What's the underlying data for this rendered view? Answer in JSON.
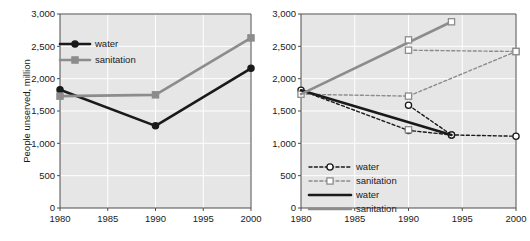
{
  "figure": {
    "panels": [
      {
        "id": "left-panel",
        "name": "actual-trends-chart",
        "chart_data": {
          "type": "line",
          "title": "",
          "xlabel": "",
          "ylabel": "People unserved, million",
          "xlim": [
            1980,
            2000
          ],
          "ylim": [
            0,
            3000
          ],
          "xticks": [
            1980,
            1985,
            1990,
            1995,
            2000
          ],
          "xtick_labels": [
            "1980",
            "1985",
            "1990",
            "1995",
            "2000"
          ],
          "yticks": [
            0,
            500,
            1000,
            1500,
            2000,
            2500,
            3000
          ],
          "ytick_labels": [
            "0",
            "500",
            "1,000",
            "1,500",
            "2,000",
            "2,500",
            "3,000"
          ],
          "grid": true,
          "legend_position": "upper-left-inside",
          "series": [
            {
              "name": "water",
              "label": "water",
              "color": "#1a1a1a",
              "style": "solid",
              "marker": "circle",
              "x": [
                1980,
                1990,
                2000
              ],
              "values": [
                1830,
                1270,
                2160
              ]
            },
            {
              "name": "sanitation",
              "label": "sanitation",
              "color": "#8c8c8c",
              "style": "solid",
              "marker": "square",
              "x": [
                1980,
                1990,
                2000
              ],
              "values": [
                1730,
                1750,
                2630
              ]
            }
          ]
        }
      },
      {
        "id": "right-panel",
        "name": "projected-trends-chart",
        "chart_data": {
          "type": "line",
          "title": "",
          "xlabel": "",
          "ylabel": "",
          "xlim": [
            1980,
            2000
          ],
          "ylim": [
            0,
            3000
          ],
          "xticks": [
            1980,
            1985,
            1990,
            1995,
            2000
          ],
          "xtick_labels": [
            "1980",
            "1985",
            "1990",
            "1995",
            "2000"
          ],
          "yticks": [
            0,
            500,
            1000,
            1500,
            2000,
            2500,
            3000
          ],
          "ytick_labels": [
            "0",
            "500",
            "1,000",
            "1,500",
            "2,000",
            "2,500",
            "3,000"
          ],
          "grid": true,
          "legend_position": "lower-left-inside",
          "series": [
            {
              "name": "water-dashed",
              "label": "water",
              "color": "#1a1a1a",
              "style": "dashed",
              "marker": "circle",
              "x": [
                1980,
                1990,
                1994,
                2000
              ],
              "values": [
                1820,
                1200,
                1130,
                1110
              ]
            },
            {
              "name": "water-dashed-upper",
              "label": "water",
              "color": "#1a1a1a",
              "style": "dashed",
              "marker": "circle",
              "x": [
                1990,
                1994
              ],
              "values": [
                1590,
                1130
              ]
            },
            {
              "name": "sanitation-dashed",
              "label": "sanitation",
              "color": "#8c8c8c",
              "style": "dashed",
              "marker": "square",
              "x": [
                1980,
                1990,
                2000
              ],
              "values": [
                1760,
                1730,
                2420
              ]
            },
            {
              "name": "sanitation-dashed-upper",
              "label": "sanitation",
              "color": "#8c8c8c",
              "style": "dashed",
              "marker": "square",
              "x": [
                1990,
                2000
              ],
              "values": [
                2440,
                2420
              ]
            },
            {
              "name": "sanitation-dashed-lower",
              "label": "sanitation",
              "color": "#8c8c8c",
              "style": "dashed",
              "marker": "square",
              "x": [
                1990
              ],
              "values": [
                1210
              ]
            },
            {
              "name": "water-solid",
              "label": "water",
              "color": "#1a1a1a",
              "style": "solid",
              "marker": "none",
              "x": [
                1980,
                1994
              ],
              "values": [
                1820,
                1130
              ]
            },
            {
              "name": "sanitation-solid",
              "label": "sanitation",
              "color": "#8c8c8c",
              "style": "solid",
              "marker": "none",
              "x": [
                1980,
                1994
              ],
              "values": [
                1760,
                2880
              ]
            },
            {
              "name": "sanitation-solid-endpoint",
              "label": "sanitation",
              "color": "#8c8c8c",
              "style": "none",
              "marker": "square",
              "x": [
                1990,
                1994
              ],
              "values": [
                2600,
                2880
              ]
            }
          ],
          "legend_entries": [
            {
              "label": "water",
              "color": "#1a1a1a",
              "style": "dashed",
              "marker": "circle"
            },
            {
              "label": "sanitation",
              "color": "#8c8c8c",
              "style": "dashed",
              "marker": "square"
            },
            {
              "label": "water",
              "color": "#1a1a1a",
              "style": "solid",
              "marker": "none"
            },
            {
              "label": "sanitation",
              "color": "#8c8c8c",
              "style": "solid",
              "marker": "none"
            }
          ]
        }
      }
    ]
  }
}
